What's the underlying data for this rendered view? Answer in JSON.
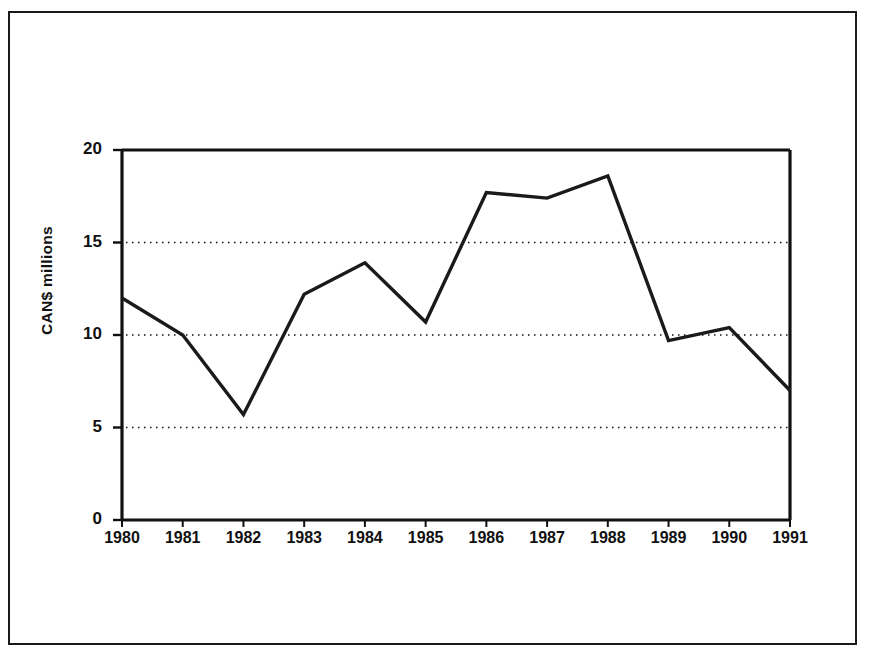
{
  "chart_data": {
    "type": "line",
    "title": "",
    "subtitle": "",
    "xlabel": "",
    "ylabel": "CAN$ millions",
    "categories": [
      "1980",
      "1981",
      "1982",
      "1983",
      "1984",
      "1985",
      "1986",
      "1987",
      "1988",
      "1989",
      "1990",
      "1991"
    ],
    "values": [
      12.0,
      10.0,
      5.7,
      12.2,
      13.9,
      10.7,
      17.7,
      17.4,
      18.6,
      9.7,
      10.4,
      7.0
    ],
    "series": [
      {
        "name": "CAN$ millions",
        "values": [
          12.0,
          10.0,
          5.7,
          12.2,
          13.9,
          10.7,
          17.7,
          17.4,
          18.6,
          9.7,
          10.4,
          7.0
        ]
      }
    ],
    "ylim": [
      0,
      20
    ],
    "yticks": [
      0,
      5,
      10,
      15,
      20
    ],
    "ytick_labels": [
      "0",
      "5",
      "10",
      "15",
      "20"
    ],
    "xtick_labels": [
      "1980",
      "1981",
      "1982",
      "1983",
      "1984",
      "1985",
      "1986",
      "1987",
      "1988",
      "1989",
      "1990",
      "1991"
    ],
    "grid": true,
    "gridline_style": "dotted",
    "gridline_values": [
      5,
      10,
      15
    ],
    "legend": false,
    "legend_position": "none",
    "line_color": "#1a1a1a",
    "axis_color": "#111111",
    "background_color": "#ffffff",
    "markers": false
  },
  "figure": {
    "border_color": "#1a1a1a"
  }
}
